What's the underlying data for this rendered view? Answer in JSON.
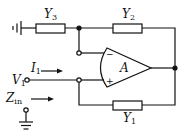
{
  "diagram": {
    "type": "circuit-schematic",
    "components": {
      "Y3": {
        "label": "Y",
        "subscript": "3"
      },
      "Y2": {
        "label": "Y",
        "subscript": "2"
      },
      "Y1": {
        "label": "Y",
        "subscript": "1"
      },
      "opamp": {
        "label": "A",
        "inverting": "−",
        "noninverting": "+"
      }
    },
    "signals": {
      "I1": {
        "label": "I",
        "subscript": "1"
      },
      "V1": {
        "label": "V",
        "subscript": "1"
      },
      "Zin": {
        "label": "Z",
        "subscript": "in"
      }
    },
    "colors": {
      "stroke": "#111111",
      "background": "#ffffff"
    }
  }
}
